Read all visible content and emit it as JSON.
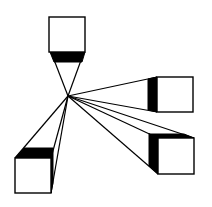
{
  "diagram": {
    "title": "",
    "colors": {
      "ink": "#000000",
      "paper": "#ffffff"
    },
    "vanishing_point": {
      "x": 68,
      "y": 96
    },
    "cubes": [
      {
        "name": "top",
        "front": {
          "x": 49,
          "y": 17,
          "w": 36,
          "h": 35
        }
      },
      {
        "name": "right-upper",
        "front": {
          "x": 157,
          "y": 77,
          "w": 36,
          "h": 35
        }
      },
      {
        "name": "right-lower",
        "front": {
          "x": 158,
          "y": 138,
          "w": 36,
          "h": 36
        }
      },
      {
        "name": "left-lower",
        "front": {
          "x": 15,
          "y": 158,
          "w": 36,
          "h": 35
        }
      }
    ]
  }
}
